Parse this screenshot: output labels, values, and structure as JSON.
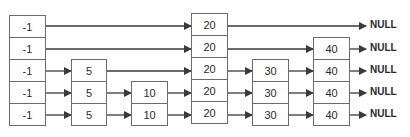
{
  "diagram": {
    "type": "skip-list",
    "levels": 5,
    "null_label": "NULL",
    "colors": {
      "stroke": "#6b6b6b",
      "arrow": "#3a3a3a",
      "text": "#2a2a2a",
      "background": "#ffffff"
    },
    "columns": [
      {
        "value": "-1",
        "height": 5
      },
      {
        "value": "5",
        "height": 3
      },
      {
        "value": "10",
        "height": 2
      },
      {
        "value": "20",
        "height": 5
      },
      {
        "value": "30",
        "height": 3
      },
      {
        "value": "40",
        "height": 4
      }
    ],
    "level_labels": [
      [
        "-1",
        "20",
        "NULL"
      ],
      [
        "-1",
        "20",
        "40",
        "NULL"
      ],
      [
        "-1",
        "5",
        "20",
        "30",
        "40",
        "NULL"
      ],
      [
        "-1",
        "5",
        "10",
        "20",
        "30",
        "40",
        "NULL"
      ],
      [
        "-1",
        "5",
        "10",
        "20",
        "30",
        "40",
        "NULL"
      ]
    ]
  }
}
